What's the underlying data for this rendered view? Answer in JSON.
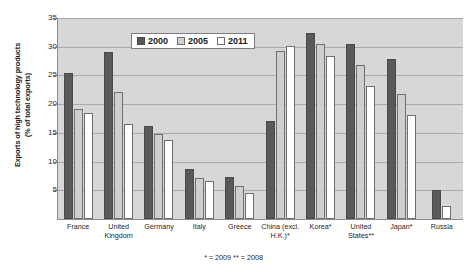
{
  "chart_data": {
    "type": "bar",
    "title": "",
    "xlabel": "",
    "ylabel": "Exports of high technology products (% of total exports)",
    "ylabel_line1": "Exports of high technology products",
    "ylabel_line2": "(% of total exports)",
    "ylim": [
      0,
      35
    ],
    "yticks": [
      0,
      5,
      10,
      15,
      20,
      25,
      30,
      35
    ],
    "ytick_labels": [
      "",
      "5",
      "10",
      "15",
      "20",
      "25",
      "30",
      "35"
    ],
    "grid": true,
    "legend_position": "top-center",
    "categories": [
      "France",
      "United Kingdom",
      "Germany",
      "Italy",
      "Greece",
      "China (excl. H.K.)*",
      "Korea*",
      "United States**",
      "Japan*",
      "Russia"
    ],
    "category_lines": [
      [
        "France"
      ],
      [
        "United",
        "Kingdom"
      ],
      [
        "Germany"
      ],
      [
        "Italy"
      ],
      [
        "Greece"
      ],
      [
        "China (excl.",
        "H.K.)*"
      ],
      [
        "Korea*"
      ],
      [
        "United",
        "States**"
      ],
      [
        "Japan*"
      ],
      [
        "Russia"
      ]
    ],
    "series": [
      {
        "name": "2000",
        "color": "#595959",
        "values": [
          25.4,
          29.0,
          16.2,
          8.7,
          7.3,
          17.0,
          32.4,
          30.5,
          27.8,
          5.0
        ]
      },
      {
        "name": "2005",
        "color": "#cfcfcf",
        "values": [
          19.2,
          22.2,
          14.8,
          7.1,
          5.8,
          29.2,
          30.4,
          26.9,
          21.7,
          0.0
        ]
      },
      {
        "name": "2011",
        "color": "#ffffff",
        "values": [
          18.5,
          16.5,
          13.7,
          6.7,
          4.6,
          30.1,
          28.3,
          23.1,
          18.1,
          2.2
        ]
      }
    ],
    "annotations": [
      "* = 2009   ** = 2008"
    ],
    "footnote": "* = 2009   ** = 2008"
  }
}
